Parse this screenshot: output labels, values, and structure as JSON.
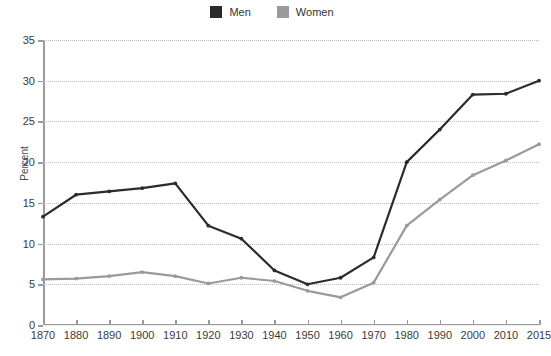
{
  "legend": {
    "position": "top-center",
    "items": [
      {
        "label": "Men",
        "color": "#2b2b2b",
        "swatch": "legend-swatch-men"
      },
      {
        "label": "Women",
        "color": "#9a9a9a",
        "swatch": "legend-swatch-women"
      }
    ]
  },
  "axes": {
    "ylabel": "Percent",
    "xlabel": "",
    "yticks": [
      "0",
      "5",
      "10",
      "15",
      "20",
      "25",
      "30",
      "35"
    ],
    "xticks": [
      "1870",
      "1880",
      "1890",
      "1900",
      "1910",
      "1920",
      "1930",
      "1940",
      "1950",
      "1960",
      "1970",
      "1980",
      "1990",
      "2000",
      "2010",
      "2015"
    ]
  },
  "chart_data": {
    "type": "line",
    "title": "",
    "subtitle": "",
    "xlabel": "",
    "ylabel": "Percent",
    "ylim": [
      0,
      35
    ],
    "ytick_step": 5,
    "grid": true,
    "legend_position": "top-center",
    "categories": [
      "1870",
      "1880",
      "1890",
      "1900",
      "1910",
      "1920",
      "1930",
      "1940",
      "1950",
      "1960",
      "1970",
      "1980",
      "1990",
      "2000",
      "2010",
      "2015"
    ],
    "series": [
      {
        "name": "Men",
        "color": "#2b2b2b",
        "values": [
          13.3,
          16.0,
          16.4,
          16.8,
          17.4,
          12.2,
          10.6,
          6.7,
          5.0,
          5.8,
          8.3,
          20.0,
          24.0,
          28.3,
          28.4,
          30.0
        ]
      },
      {
        "name": "Women",
        "color": "#9a9a9a",
        "values": [
          5.6,
          5.7,
          6.0,
          6.5,
          6.0,
          5.1,
          5.8,
          5.4,
          4.2,
          3.4,
          5.2,
          12.2,
          15.4,
          18.4,
          20.2,
          22.2
        ]
      }
    ]
  },
  "colors": {
    "men": "#2b2b2b",
    "women": "#9a9a9a",
    "axis": "#9b9b9b",
    "grid": "#b9b9c9",
    "background": "#ffffff"
  }
}
